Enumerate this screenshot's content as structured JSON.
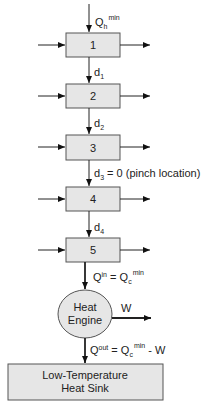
{
  "diagram": {
    "top_input_label": {
      "main": "Q",
      "sub": "h",
      "sup": "min"
    },
    "intervals": [
      {
        "label": "1"
      },
      {
        "label": "2"
      },
      {
        "label": "3"
      },
      {
        "label": "4"
      },
      {
        "label": "5"
      }
    ],
    "deficits": [
      {
        "main": "d",
        "sub": "1",
        "suffix": ""
      },
      {
        "main": "d",
        "sub": "2",
        "suffix": ""
      },
      {
        "main": "d",
        "sub": "3",
        "suffix": " = 0 (pinch location)"
      },
      {
        "main": "d",
        "sub": "4",
        "suffix": ""
      }
    ],
    "heat_in_label": {
      "lhs": "Q",
      "lhs_sup": "in",
      "eq": " = ",
      "rhs": "Q",
      "rhs_sub": "c",
      "rhs_sup": "min"
    },
    "engine": {
      "line1": "Heat",
      "line2": "Engine"
    },
    "work_label": "W",
    "heat_out_label": {
      "lhs": "Q",
      "lhs_sup": "out",
      "eq": " = ",
      "rhs": "Q",
      "rhs_sub": "c",
      "rhs_sup": "min",
      "tail": " - W"
    },
    "sink": {
      "line1": "Low-Temperature",
      "line2": "Heat Sink"
    }
  }
}
